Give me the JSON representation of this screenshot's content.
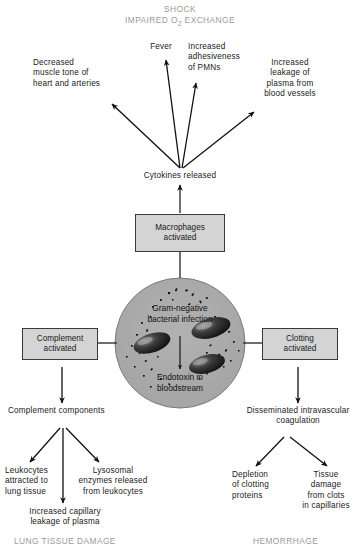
{
  "diagram": {
    "title_top": "SHOCK",
    "subtitle_top": "IMPAIRED O2 EXCHANGE",
    "subtitle_top_pre": "IMPAIRED O",
    "subtitle_top_sub": "2",
    "subtitle_top_post": " EXCHANGE",
    "outcome_left": "LUNG TISSUE DAMAGE",
    "outcome_right": "HEMORRHAGE",
    "colors": {
      "background": "#ffffff",
      "text": "#1a1a1a",
      "outcome_text": "#9a9a9a",
      "box_fill": "#d4d4d4",
      "box_border": "#3a3a3a",
      "circle_fill": "#a8a8a8",
      "circle_border": "#6e6e6e",
      "bacteria": "#1c1c1c",
      "arrow": "#111111"
    },
    "labels": {
      "decreased_muscle_tone": "Decreased\nmuscle tone of\nheart and arteries",
      "fever": "Fever",
      "increased_adhesiveness": "Increased\nadhesiveness\nof PMNs",
      "increased_leakage": "Increased\nleakage of\nplasma from\nblood vessels",
      "cytokines_released": "Cytokines released",
      "complement_components": "Complement components",
      "leukocytes_attracted": "Leukocytes\nattracted to\nlung tissue",
      "lysosomal_enzymes": "Lysosomal\nenzymes released\nfrom leukocytes",
      "increased_capillary_leakage": "Increased capillary\nleakage of plasma",
      "dic": "Disseminated intravascular\ncoagulation",
      "depletion_clotting": "Depletion\nof clotting\nproteins",
      "tissue_damage_clots": "Tissue\ndamage\nfrom clots\nin capillaries"
    },
    "boxes": {
      "macrophages_activated": "Macrophages\nactivated",
      "complement_activated": "Complement\nactivated",
      "clotting_activated": "Clotting\nactivated"
    },
    "circle": {
      "top_label": "Gram-negative\nbacterial infection",
      "bottom_label": "Endotoxin in\nbloodstream"
    }
  }
}
